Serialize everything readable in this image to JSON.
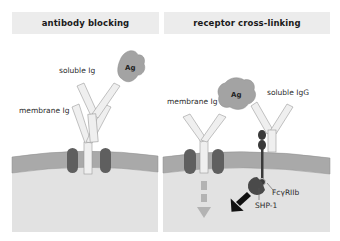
{
  "panels": {
    "left": {
      "title": "antibody blocking",
      "labels": {
        "soluble": "soluble Ig",
        "membrane": "membrane Ig",
        "antigen": "Ag"
      }
    },
    "right": {
      "title": "receptor cross-linking",
      "labels": {
        "membrane": "membrane Ig",
        "soluble": "soluble IgG",
        "antigen": "Ag",
        "receptor": "FcγRIIb",
        "phosphatase": "SHP-1"
      }
    }
  },
  "colors": {
    "header_bg": "#ececec",
    "cytoplasm": "#e0e0e0",
    "membrane": "#a9a9a9",
    "antibody": "#eeeeee",
    "antibody_stroke": "#9a9a9a",
    "antigen": "#a3a3a3",
    "ig_alpha_beta": "#5f5f5f",
    "receptor": "#3a3a3a",
    "arrow_dark": "#111111",
    "arrow_dashed": "#b3b3b3"
  }
}
